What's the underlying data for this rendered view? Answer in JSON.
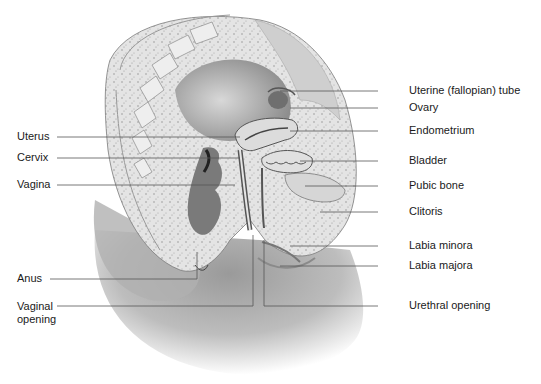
{
  "diagram": {
    "style": "grayscale medical illustration",
    "colors": {
      "background": "#ffffff",
      "label_text": "#1a1a1a",
      "leader_line": "#555555",
      "tissue_light": "#e6e6e6",
      "tissue_mid": "#b8b8b8",
      "tissue_dark": "#6a6a6a"
    }
  },
  "labels": {
    "left": [
      {
        "id": "uterus",
        "text": "Uterus"
      },
      {
        "id": "cervix",
        "text": "Cervix"
      },
      {
        "id": "vagina",
        "text": "Vagina"
      },
      {
        "id": "anus",
        "text": "Anus"
      },
      {
        "id": "vaginal_opening",
        "text": "Vaginal\nopening"
      }
    ],
    "right": [
      {
        "id": "uterine_tube",
        "text": "Uterine (fallopian) tube"
      },
      {
        "id": "ovary",
        "text": "Ovary"
      },
      {
        "id": "endometrium",
        "text": "Endometrium"
      },
      {
        "id": "bladder",
        "text": "Bladder"
      },
      {
        "id": "pubic_bone",
        "text": "Pubic bone"
      },
      {
        "id": "clitoris",
        "text": "Clitoris"
      },
      {
        "id": "labia_minora",
        "text": "Labia minora"
      },
      {
        "id": "labia_majora",
        "text": "Labia majora"
      },
      {
        "id": "urethral_opening",
        "text": "Urethral opening"
      }
    ]
  }
}
